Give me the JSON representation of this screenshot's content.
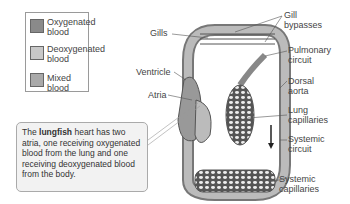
{
  "legend": {
    "items": [
      {
        "label_line1": "Oxygenated",
        "label_line2": "blood",
        "color": "#8a8a8a"
      },
      {
        "label_line1": "Deoxygenated",
        "label_line2": "blood",
        "color": "#c8c8c8"
      },
      {
        "label_line1": "Mixed blood",
        "label_line2": "",
        "color": "#a9a9a9"
      }
    ]
  },
  "labels": {
    "gills": "Gills",
    "gill_bypasses_1": "Gill",
    "gill_bypasses_2": "bypasses",
    "pulmonary_1": "Pulmonary",
    "pulmonary_2": "circuit",
    "dorsal_1": "Dorsal",
    "dorsal_2": "aorta",
    "ventricle": "Ventricle",
    "atria": "Atria",
    "lung_1": "Lung",
    "lung_2": "capillaries",
    "systemic_1": "Systemic",
    "systemic_2": "circuit",
    "syscap_1": "Systemic",
    "syscap_2": "capillaries"
  },
  "note": {
    "prefix": "The ",
    "bold": "lungfish",
    "suffix": " heart has two atria, one receiving oxygenated blood from the lung and one receiving deoxygenated blood from the body."
  }
}
